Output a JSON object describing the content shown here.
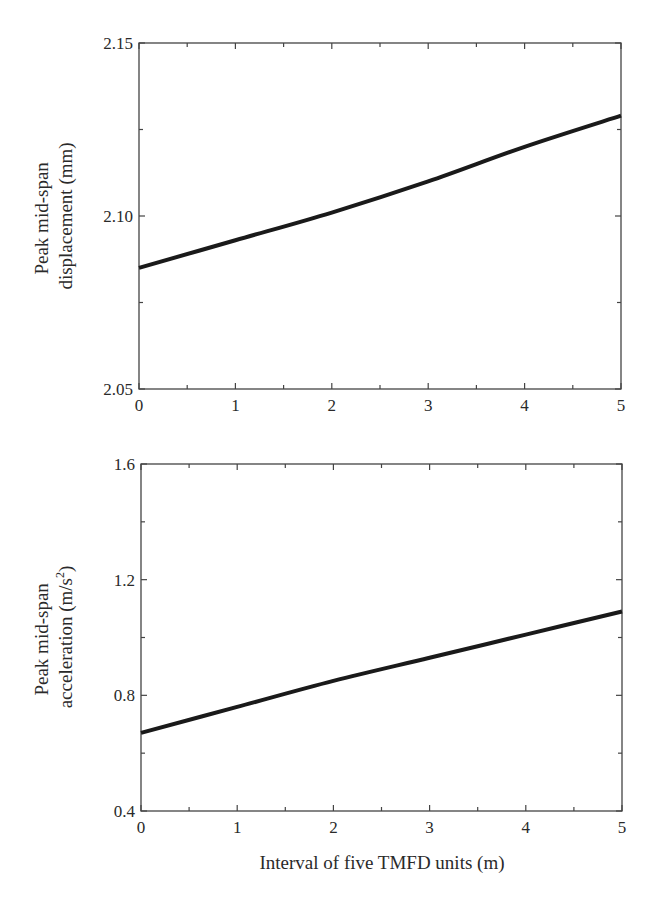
{
  "chart_data": [
    {
      "type": "line",
      "title": "",
      "xlabel": "",
      "ylabel": "Peak mid-span displacement (mm)",
      "ylabel_lines": [
        "Peak mid-span",
        "displacement (mm)"
      ],
      "xlim": [
        0,
        5
      ],
      "ylim": [
        2.05,
        2.15
      ],
      "x_ticks": [
        "0",
        "1",
        "2",
        "3",
        "4",
        "5"
      ],
      "y_ticks": [
        "2.05",
        "2.10",
        "2.15"
      ],
      "grid": false,
      "legend": null,
      "x": [
        0,
        1,
        2,
        3,
        4,
        5
      ],
      "series": [
        {
          "name": "displacement",
          "values": [
            2.085,
            2.093,
            2.101,
            2.11,
            2.12,
            2.129
          ]
        }
      ]
    },
    {
      "type": "line",
      "title": "",
      "xlabel": "Interval of five TMFD units (m)",
      "ylabel": "Peak mid-span acceleration (m/s^2)",
      "ylabel_lines": [
        "Peak mid-span",
        "acceleration (m/s",
        "2",
        ")"
      ],
      "xlim": [
        0,
        5
      ],
      "ylim": [
        0.4,
        1.6
      ],
      "x_ticks": [
        "0",
        "1",
        "2",
        "3",
        "4",
        "5"
      ],
      "y_ticks": [
        "0.4",
        "0.8",
        "1.2",
        "1.6"
      ],
      "grid": false,
      "legend": null,
      "x": [
        0,
        1,
        2,
        3,
        4,
        5
      ],
      "series": [
        {
          "name": "acceleration",
          "values": [
            0.67,
            0.76,
            0.85,
            0.93,
            1.01,
            1.09
          ]
        }
      ]
    }
  ],
  "colors": {
    "line": "#1a1a1a",
    "axis": "#444444"
  }
}
